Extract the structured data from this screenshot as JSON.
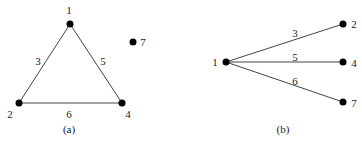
{
  "diagrams": [
    {
      "caption": "(a)",
      "nodes": [
        {
          "id": "1",
          "label": "1",
          "x": 70,
          "y": 24,
          "lx": 69,
          "ly": 14
        },
        {
          "id": "2",
          "label": "2",
          "x": 19,
          "y": 103,
          "lx": 10,
          "ly": 118
        },
        {
          "id": "4",
          "label": "4",
          "x": 122,
          "y": 103,
          "lx": 128,
          "ly": 118
        },
        {
          "id": "7",
          "label": "7",
          "x": 133,
          "y": 42,
          "lx": 143,
          "ly": 46
        }
      ],
      "edges": [
        {
          "from": "1",
          "to": "2",
          "weight": "3",
          "lx": 38,
          "ly": 65
        },
        {
          "from": "1",
          "to": "4",
          "weight": "5",
          "lx": 103,
          "ly": 65
        },
        {
          "from": "2",
          "to": "4",
          "weight": "6",
          "lx": 69,
          "ly": 118
        }
      ]
    },
    {
      "caption": "(b)",
      "nodes": [
        {
          "id": "1",
          "label": "1",
          "x": 226,
          "y": 62,
          "lx": 215,
          "ly": 66
        },
        {
          "id": "2",
          "label": "2",
          "x": 343,
          "y": 24,
          "lx": 354,
          "ly": 28
        },
        {
          "id": "4",
          "label": "4",
          "x": 343,
          "y": 62,
          "lx": 354,
          "ly": 67
        },
        {
          "id": "7",
          "label": "7",
          "x": 343,
          "y": 102,
          "lx": 354,
          "ly": 107
        }
      ],
      "edges": [
        {
          "from": "1",
          "to": "2",
          "weight": "3",
          "lx": 295,
          "ly": 37
        },
        {
          "from": "1",
          "to": "4",
          "weight": "5",
          "lx": 295,
          "ly": 61
        },
        {
          "from": "1",
          "to": "7",
          "weight": "6",
          "lx": 295,
          "ly": 85
        }
      ]
    }
  ],
  "captions": {
    "a": "(a)",
    "b": "(b)"
  }
}
